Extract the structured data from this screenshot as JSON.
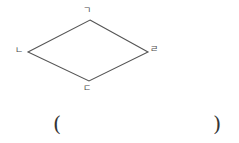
{
  "figure": {
    "type": "quadrilateral",
    "shape_name": "kite",
    "stroke_color": "#555555",
    "background_color": "#ffffff",
    "vertices": [
      {
        "id": "top",
        "label": "ㄱ",
        "label_romanization": "giyeok",
        "x": 90,
        "y": 20
      },
      {
        "id": "right",
        "label": "ㄹ",
        "label_romanization": "rieul",
        "x": 148,
        "y": 52
      },
      {
        "id": "bottom",
        "label": "ㄷ",
        "label_romanization": "digeut",
        "x": 89,
        "y": 81
      },
      {
        "id": "left",
        "label": "ㄴ",
        "label_romanization": "nieun",
        "x": 28,
        "y": 52
      }
    ],
    "edges": [
      {
        "from": "top",
        "to": "right"
      },
      {
        "from": "right",
        "to": "bottom"
      },
      {
        "from": "bottom",
        "to": "left"
      },
      {
        "from": "left",
        "to": "top"
      }
    ]
  },
  "answer_blank": {
    "open_paren": "(",
    "close_paren": ")",
    "content": ""
  }
}
